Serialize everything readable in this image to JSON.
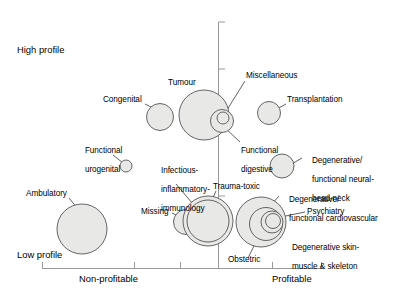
{
  "chart_data": {
    "type": "scatter",
    "title": "",
    "xlabel": "",
    "ylabel": "",
    "x_axis": {
      "left_label": "Non-profitable",
      "right_label": "Profitable",
      "ticks": 6,
      "grid": false
    },
    "y_axis": {
      "top_label": "High profile",
      "bottom_label": "Low profile",
      "grid": false
    },
    "quadrant_labels": {
      "top_left": "High profile",
      "bottom_left": "Low profile",
      "x_left": "Non-profitable",
      "x_right": "Profitable"
    },
    "bubble_fill": "#e8e8e6",
    "bubble_stroke": "#555555",
    "axis_color": "#999999",
    "leader_color": "#444444",
    "points": [
      {
        "name": "Congenital",
        "cx": 160,
        "cy": 117,
        "r": 13.5
      },
      {
        "name": "Tumour",
        "cx": 204,
        "cy": 115,
        "r": 25.0
      },
      {
        "name": "Functional digestive",
        "cx": 222,
        "cy": 121,
        "r": 11.5
      },
      {
        "name": "Miscellaneous",
        "cx": 223,
        "cy": 118,
        "r": 6.0
      },
      {
        "name": "Transplantation",
        "cx": 269,
        "cy": 113,
        "r": 11.5
      },
      {
        "name": "Degenerative/ functional neural-head-neck",
        "cx": 282,
        "cy": 166,
        "r": 12.0
      },
      {
        "name": "Functional urogenital",
        "cx": 126,
        "cy": 166,
        "r": 6.0
      },
      {
        "name": "Ambulatory",
        "cx": 82,
        "cy": 229,
        "r": 25.0
      },
      {
        "name": "Missing",
        "cx": 186,
        "cy": 222,
        "r": 12.5
      },
      {
        "name": "Infectious-inflammatory-immunology",
        "cx": 208,
        "cy": 221,
        "r": 25.0
      },
      {
        "name": "Trauma-toxic",
        "cx": 208,
        "cy": 221,
        "r": 21.0
      },
      {
        "name": "Degenerative/ functional cardiovascular",
        "cx": 261,
        "cy": 222,
        "r": 25.0
      },
      {
        "name": "Obstetric",
        "cx": 266,
        "cy": 224,
        "r": 16.5
      },
      {
        "name": "Degenerative skin-muscle & skeleton",
        "cx": 272,
        "cy": 222,
        "r": 11.0
      },
      {
        "name": "Psychiatry",
        "cx": 273,
        "cy": 221,
        "r": 7.5
      }
    ]
  },
  "labels": {
    "high_profile": "High profile",
    "low_profile": "Low profile",
    "non_profitable": "Non-profitable",
    "profitable": "Profitable",
    "congenital": "Congenital",
    "tumour": "Tumour",
    "miscellaneous": "Miscellaneous",
    "transplantation": "Transplantation",
    "functional_digestive_l1": "Functional",
    "functional_digestive_l2": "digestive",
    "degenerative_neural_l1": "Degenerative/",
    "degenerative_neural_l2": "functional neural-",
    "degenerative_neural_l3": "head-neck",
    "functional_urogenital_l1": "Functional",
    "functional_urogenital_l2": "urogenital",
    "infectious_l1": "Infectious-",
    "infectious_l2": "inflammatory-",
    "infectious_l3": "immunology",
    "ambulatory": "Ambulatory",
    "missing": "Missing",
    "trauma_toxic": "Trauma-toxic",
    "degenerative_cardio_l1": "Degenerative/",
    "degenerative_cardio_l2": "functional cardiovascular",
    "psychiatry": "Psychiatry",
    "degenerative_skin_l1": "Degenerative skin-",
    "degenerative_skin_l2": "muscle & skeleton",
    "obstetric": "Obstetric"
  }
}
